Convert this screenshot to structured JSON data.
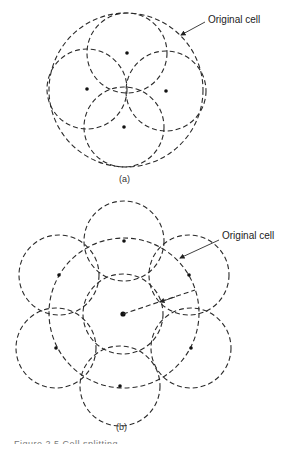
{
  "figure_a": {
    "label": "(a)",
    "callout": "Original cell",
    "original_cell": {
      "cx": 126,
      "cy": 90,
      "r": 77
    },
    "subcells": [
      {
        "cx": 127,
        "cy": 53,
        "r": 40
      },
      {
        "cx": 87,
        "cy": 89,
        "r": 40
      },
      {
        "cx": 166,
        "cy": 91,
        "r": 40
      },
      {
        "cx": 124,
        "cy": 127,
        "r": 40
      }
    ]
  },
  "figure_b": {
    "label": "(b)",
    "callout": "Original cell",
    "original_cell": {
      "cx": 124,
      "cy": 313,
      "r": 75
    },
    "subcells": [
      {
        "cx": 123,
        "cy": 314,
        "r": 40
      },
      {
        "cx": 124,
        "cy": 241,
        "r": 40
      },
      {
        "cx": 189,
        "cy": 275,
        "r": 40
      },
      {
        "cx": 191,
        "cy": 348,
        "r": 40
      },
      {
        "cx": 120,
        "cy": 386,
        "r": 40
      },
      {
        "cx": 56,
        "cy": 348,
        "r": 40
      },
      {
        "cx": 59,
        "cy": 275,
        "r": 40
      }
    ]
  },
  "caption": "Figure 2.5  Cell splitting"
}
